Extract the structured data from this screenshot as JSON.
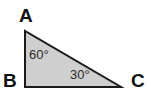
{
  "figure": {
    "type": "geometry-diagram",
    "shape": "right-triangle",
    "background_color": "#ffffff",
    "fill_color": "#cfcfcf",
    "stroke_color": "#1a1a1a",
    "stroke_width": 2,
    "vertices": [
      {
        "id": "A",
        "label": "A",
        "x": 25,
        "y": 31,
        "label_x": 19,
        "label_y": 6
      },
      {
        "id": "B",
        "label": "B",
        "x": 25,
        "y": 87,
        "label_x": 3,
        "label_y": 71
      },
      {
        "id": "C",
        "label": "C",
        "x": 121,
        "y": 87,
        "label_x": 131,
        "label_y": 71
      }
    ],
    "angles": [
      {
        "at_vertex": "A",
        "label": "60°",
        "value": 60,
        "unit": "degrees",
        "label_x": 29,
        "label_y": 48
      },
      {
        "at_vertex": "C",
        "label": "30°",
        "value": 30,
        "unit": "degrees",
        "label_x": 70,
        "label_y": 68
      },
      {
        "at_vertex": "B",
        "label": "",
        "value": 90,
        "unit": "degrees",
        "label_x": 0,
        "label_y": 0
      }
    ],
    "edges": [
      {
        "from": "A",
        "to": "B"
      },
      {
        "from": "B",
        "to": "C"
      },
      {
        "from": "C",
        "to": "A"
      }
    ]
  }
}
